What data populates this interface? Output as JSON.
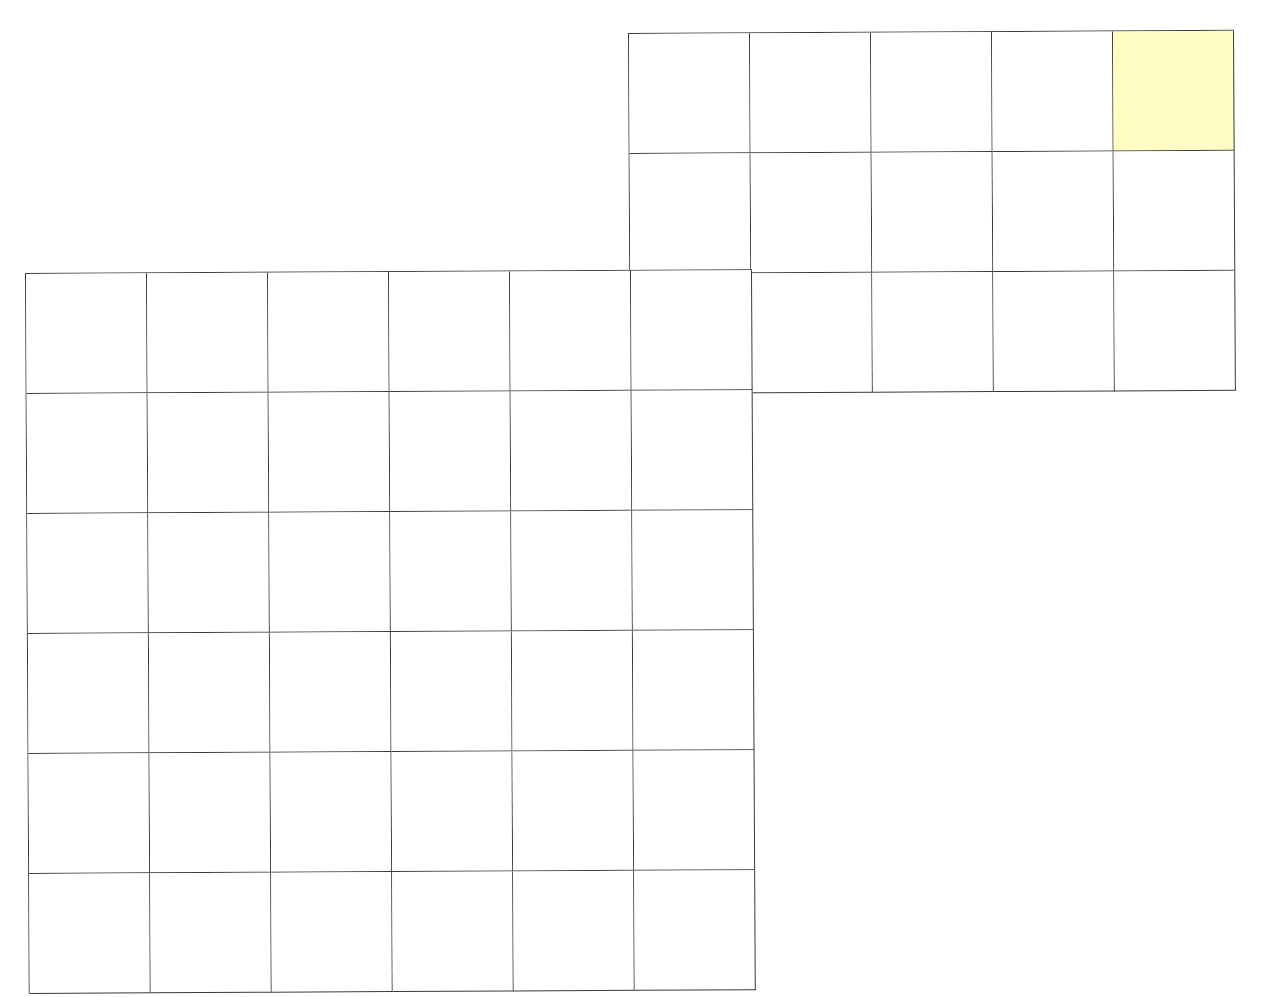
{
  "diagram": {
    "type": "grid-layout",
    "cell_size_px": 121,
    "line_color": "#3a3a3a",
    "background": "#ffffff",
    "highlight_color": "#fffcc4",
    "grids": [
      {
        "name": "upper-right-grid",
        "rows": 3,
        "cols": 5,
        "origin": [
          628,
          33
        ],
        "highlighted_cells": [
          [
            0,
            4
          ]
        ]
      },
      {
        "name": "lower-left-grid",
        "rows": 6,
        "cols": 6,
        "origin": [
          25,
          273
        ],
        "highlighted_cells": []
      }
    ],
    "note": "Two overlapping rectangular grids sharing the cell at lower-grid row 0 col 5 / upper-grid row 2 col 0; one highlighted cell at top-right corner."
  }
}
